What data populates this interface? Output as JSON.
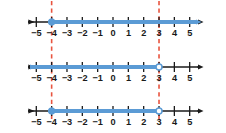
{
  "figure": {
    "kind": "number-line-inequality-diagram",
    "colors": {
      "axis": "#1a1a1a",
      "solution": "#5b9bd5",
      "guide": "#e8543f",
      "background": "#ffffff",
      "label": "#1a1a1a"
    },
    "axis": {
      "min": -5.9,
      "max": 5.9,
      "tick_min": -5,
      "tick_max": 5,
      "tick_step": 1,
      "tick_labels": [
        "−5",
        "−4",
        "−3",
        "−2",
        "−1",
        "0",
        "1",
        "2",
        "3",
        "4",
        "5"
      ],
      "tick_values": [
        -5,
        -4,
        -3,
        -2,
        -1,
        0,
        1,
        2,
        3,
        4,
        5
      ]
    },
    "guides": [
      {
        "name": "guide-at-negative-4",
        "value": -4,
        "style": "dashed"
      },
      {
        "name": "guide-at-3",
        "value": 3,
        "style": "dashed"
      }
    ],
    "lines": [
      {
        "name": "number-line-1",
        "inequality": "x ≥ −4",
        "solution_from": -4,
        "solution_to": 5.9,
        "left_arrow_color": "axis",
        "right_arrow_color": "solution",
        "endpoints": [
          {
            "value": -4,
            "type": "closed"
          }
        ]
      },
      {
        "name": "number-line-2",
        "inequality": "x < 3",
        "solution_from": -5.9,
        "solution_to": 3,
        "left_arrow_color": "solution",
        "right_arrow_color": "axis",
        "endpoints": [
          {
            "value": 3,
            "type": "open"
          }
        ]
      },
      {
        "name": "number-line-3",
        "inequality": "−4 ≤ x < 3",
        "solution_from": -4,
        "solution_to": 3,
        "left_arrow_color": "axis",
        "right_arrow_color": "axis",
        "endpoints": [
          {
            "value": -4,
            "type": "closed"
          },
          {
            "value": 3,
            "type": "open"
          }
        ]
      }
    ]
  }
}
